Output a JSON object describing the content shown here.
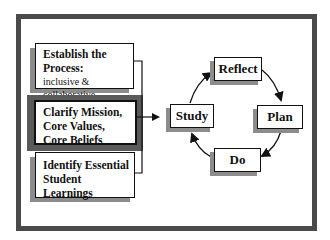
{
  "diagram": {
    "left_boxes": [
      {
        "title_line1": "Establish the",
        "title_line2": "Process:",
        "subtitle": "inclusive & collaborative",
        "highlighted": false
      },
      {
        "line1": "Clarify Mission,",
        "line2": "Core Values,",
        "line3": "Core Beliefs",
        "highlighted": true
      },
      {
        "line1": "Identify Essential",
        "line2": "Student Learnings",
        "highlighted": false
      }
    ],
    "cycle": {
      "top": "Reflect",
      "right": "Plan",
      "bottom": "Do",
      "left": "Study",
      "direction": "clockwise"
    },
    "colors": {
      "frame": "#4a4a4a",
      "shadow": "#8c8c8c",
      "highlight_border": "#5a5a5a",
      "line": "#111111"
    }
  }
}
